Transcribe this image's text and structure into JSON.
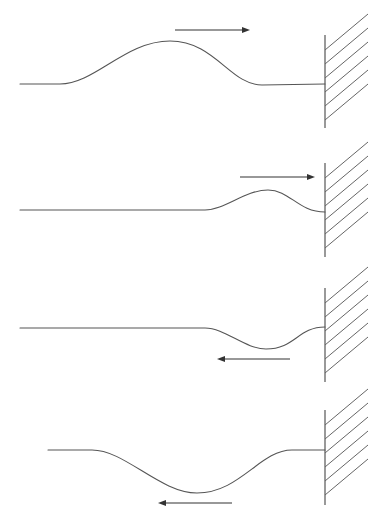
{
  "diagram": {
    "title": "",
    "colors": {
      "line": "#555555",
      "arrow": "#333333",
      "background": "#ffffff"
    },
    "panels": [
      {
        "id": "panel-1",
        "stage": "incident pulse travelling toward wall",
        "arrow_direction": "right",
        "wave_path": "M20,84 L60,84 C95,84 125,41 170,41 C215,41 230,85 262,85 L325,84",
        "arrow": {
          "x1": 175,
          "y1": 30,
          "x2": 250,
          "y2": 30
        },
        "wall": {
          "x": 325,
          "y_top": 35,
          "y_bottom": 128
        }
      },
      {
        "id": "panel-2",
        "stage": "pulse arriving at wall",
        "arrow_direction": "right",
        "wave_path": "M20,210 L205,210 C225,210 245,190 268,190 C290,190 298,212 325,212",
        "arrow": {
          "x1": 240,
          "y1": 177,
          "x2": 315,
          "y2": 177
        },
        "wall": {
          "x": 325,
          "y_top": 163,
          "y_bottom": 257
        }
      },
      {
        "id": "panel-3",
        "stage": "pulse inverting at wall",
        "arrow_direction": "left",
        "wave_path": "M20,328 L205,328 C225,328 245,349 266,349 C295,349 298,327 325,327",
        "arrow": {
          "x1": 290,
          "y1": 359,
          "x2": 217,
          "y2": 359
        },
        "wall": {
          "x": 325,
          "y_top": 288,
          "y_bottom": 382
        }
      },
      {
        "id": "panel-4",
        "stage": "inverted reflected pulse travelling away from wall",
        "arrow_direction": "left",
        "wave_path": "M48,450 L92,450 C125,450 160,493 197,493 C240,493 260,450 292,450 L325,450",
        "arrow": {
          "x1": 232,
          "y1": 503,
          "x2": 158,
          "y2": 503
        },
        "wall": {
          "x": 325,
          "y_top": 410,
          "y_bottom": 505
        }
      }
    ],
    "hatch": {
      "count": 6,
      "spacing": 14,
      "dx": 43,
      "dy": -36,
      "first_offset": 15
    }
  }
}
